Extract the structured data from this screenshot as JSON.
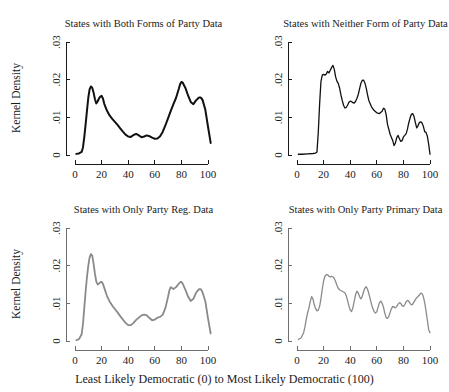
{
  "figure": {
    "xlabel": "Least Likely Democratic (0) to Most Likely Democratic (100)",
    "ylabel": "Kernel Density",
    "background_color": "#ffffff"
  },
  "chart_data": [
    {
      "type": "line",
      "panel": "top-left",
      "title": "States with Both Forms of Party Data",
      "xlabel": "",
      "ylabel": "Kernel Density",
      "xlim": [
        0,
        103
      ],
      "ylim": [
        0,
        0.03
      ],
      "xticks": [
        0,
        20,
        40,
        60,
        80,
        100
      ],
      "xtick_labels": [
        "0",
        "20",
        "40",
        "60",
        "80",
        "100"
      ],
      "yticks": [
        0,
        0.01,
        0.02,
        0.03
      ],
      "ytick_labels": [
        "0",
        ".01",
        ".02",
        ".03"
      ],
      "grid": false,
      "legend": "none",
      "line_color": "#111111",
      "line_width": 2.0,
      "x": [
        1,
        3,
        5,
        6,
        7,
        8,
        9,
        10,
        11,
        12,
        13,
        14,
        15,
        16,
        17,
        18,
        19,
        20,
        21,
        22,
        24,
        26,
        28,
        30,
        32,
        34,
        36,
        38,
        40,
        42,
        44,
        46,
        48,
        50,
        52,
        54,
        56,
        58,
        60,
        62,
        64,
        66,
        68,
        70,
        72,
        74,
        76,
        78,
        79,
        80,
        81,
        83,
        85,
        87,
        89,
        91,
        93,
        94,
        95,
        96,
        98,
        100,
        102
      ],
      "y": [
        0.0003,
        0.0004,
        0.0008,
        0.002,
        0.0048,
        0.0082,
        0.0118,
        0.0152,
        0.0175,
        0.0182,
        0.0178,
        0.0165,
        0.0148,
        0.0137,
        0.0142,
        0.015,
        0.0155,
        0.0157,
        0.015,
        0.0136,
        0.0118,
        0.0105,
        0.0096,
        0.0088,
        0.008,
        0.0071,
        0.0062,
        0.0054,
        0.0049,
        0.0048,
        0.0053,
        0.0056,
        0.0052,
        0.0047,
        0.0049,
        0.0052,
        0.005,
        0.0046,
        0.0043,
        0.0044,
        0.005,
        0.0062,
        0.0079,
        0.0098,
        0.0117,
        0.0135,
        0.0152,
        0.0175,
        0.0188,
        0.0194,
        0.0192,
        0.0178,
        0.0158,
        0.0141,
        0.0135,
        0.0145,
        0.0152,
        0.0153,
        0.0151,
        0.0145,
        0.012,
        0.0075,
        0.0032
      ]
    },
    {
      "type": "line",
      "panel": "top-right",
      "title": "States with Neither Form of Party Data",
      "xlabel": "",
      "ylabel": "",
      "xlim": [
        0,
        103
      ],
      "ylim": [
        0,
        0.03
      ],
      "xticks": [
        0,
        20,
        40,
        60,
        80,
        100
      ],
      "xtick_labels": [
        "0",
        "20",
        "40",
        "60",
        "80",
        "100"
      ],
      "yticks": [
        0,
        0.01,
        0.02,
        0.03
      ],
      "ytick_labels": [
        "0",
        ".01",
        ".02",
        ".03"
      ],
      "grid": false,
      "legend": "none",
      "line_color": "#111111",
      "line_width": 1.3,
      "x": [
        1,
        4,
        8,
        12,
        14,
        15,
        16,
        17,
        18,
        19,
        20,
        21,
        22,
        23,
        24,
        25,
        26,
        27,
        28,
        29,
        30,
        31,
        32,
        33,
        34,
        35,
        36,
        37,
        38,
        39,
        40,
        41,
        42,
        43,
        44,
        45,
        46,
        47,
        48,
        49,
        50,
        51,
        52,
        53,
        54,
        56,
        58,
        60,
        62,
        64,
        65,
        66,
        67,
        68,
        70,
        72,
        73,
        74,
        75,
        76,
        77,
        78,
        79,
        80,
        81,
        82,
        83,
        84,
        85,
        86,
        87,
        88,
        89,
        90,
        91,
        92,
        93,
        94,
        95,
        96,
        97,
        98,
        99,
        100
      ],
      "y": [
        0.0002,
        0.0002,
        0.0003,
        0.0004,
        0.0005,
        0.0008,
        0.006,
        0.0135,
        0.0195,
        0.0212,
        0.0214,
        0.0212,
        0.0215,
        0.0222,
        0.0218,
        0.0225,
        0.0232,
        0.0238,
        0.0228,
        0.0208,
        0.0196,
        0.019,
        0.0178,
        0.016,
        0.0145,
        0.0132,
        0.0125,
        0.0126,
        0.0132,
        0.014,
        0.0143,
        0.0142,
        0.0139,
        0.0138,
        0.0142,
        0.015,
        0.016,
        0.0175,
        0.019,
        0.0198,
        0.0199,
        0.0192,
        0.0178,
        0.016,
        0.0145,
        0.0128,
        0.0118,
        0.0112,
        0.011,
        0.0116,
        0.0124,
        0.0122,
        0.0108,
        0.0082,
        0.0055,
        0.0038,
        0.0025,
        0.0032,
        0.0046,
        0.0052,
        0.0043,
        0.0036,
        0.0038,
        0.0048,
        0.0052,
        0.0056,
        0.0068,
        0.0085,
        0.0098,
        0.0108,
        0.011,
        0.0102,
        0.0086,
        0.0072,
        0.0078,
        0.0086,
        0.0088,
        0.0085,
        0.0076,
        0.0062,
        0.006,
        0.005,
        0.0028,
        0.0002
      ]
    },
    {
      "type": "line",
      "panel": "bottom-left",
      "title": "States with Only Party Reg. Data",
      "xlabel": "",
      "ylabel": "Kernel Density",
      "xlim": [
        0,
        103
      ],
      "ylim": [
        0,
        0.03
      ],
      "xticks": [
        0,
        20,
        40,
        60,
        80,
        100
      ],
      "xtick_labels": [
        "0",
        "20",
        "40",
        "60",
        "80",
        "100"
      ],
      "yticks": [
        0,
        0.01,
        0.02,
        0.03
      ],
      "ytick_labels": [
        "0",
        ".01",
        ".02",
        ".03"
      ],
      "grid": false,
      "legend": "none",
      "line_color": "#8a8a8a",
      "line_width": 1.8,
      "x": [
        1,
        3,
        5,
        6,
        7,
        8,
        9,
        10,
        11,
        12,
        13,
        14,
        15,
        16,
        17,
        18,
        19,
        20,
        21,
        22,
        24,
        26,
        28,
        30,
        32,
        34,
        36,
        38,
        40,
        42,
        44,
        46,
        48,
        50,
        52,
        54,
        56,
        58,
        60,
        62,
        64,
        66,
        68,
        70,
        71,
        72,
        74,
        76,
        78,
        79,
        80,
        81,
        83,
        85,
        87,
        89,
        91,
        93,
        94,
        95,
        96,
        98,
        100,
        102
      ],
      "y": [
        0.0002,
        0.0005,
        0.0018,
        0.0045,
        0.0088,
        0.0132,
        0.017,
        0.02,
        0.0222,
        0.0231,
        0.0226,
        0.0205,
        0.0178,
        0.0158,
        0.015,
        0.0152,
        0.0156,
        0.0157,
        0.0152,
        0.0141,
        0.012,
        0.0105,
        0.0094,
        0.0085,
        0.0076,
        0.0066,
        0.0057,
        0.0048,
        0.0042,
        0.0042,
        0.0048,
        0.0056,
        0.0062,
        0.0068,
        0.007,
        0.0068,
        0.0061,
        0.0055,
        0.0057,
        0.0062,
        0.0064,
        0.007,
        0.0088,
        0.0118,
        0.0135,
        0.0143,
        0.0138,
        0.0143,
        0.0152,
        0.0156,
        0.0157,
        0.0152,
        0.0136,
        0.0118,
        0.0106,
        0.0112,
        0.0128,
        0.0137,
        0.0138,
        0.0136,
        0.0128,
        0.0105,
        0.006,
        0.002
      ]
    },
    {
      "type": "line",
      "panel": "bottom-right",
      "title": "States with Only Party Primary Data",
      "xlabel": "",
      "ylabel": "",
      "xlim": [
        0,
        103
      ],
      "ylim": [
        0,
        0.03
      ],
      "xticks": [
        0,
        20,
        40,
        60,
        80,
        100
      ],
      "xtick_labels": [
        "0",
        "20",
        "40",
        "60",
        "80",
        "100"
      ],
      "yticks": [
        0,
        0.01,
        0.02,
        0.03
      ],
      "ytick_labels": [
        "0",
        ".01",
        ".02",
        ".03"
      ],
      "grid": false,
      "legend": "none",
      "line_color": "#8a8a8a",
      "line_width": 1.3,
      "x": [
        1,
        3,
        5,
        6,
        7,
        8,
        9,
        10,
        11,
        12,
        13,
        14,
        15,
        16,
        17,
        18,
        19,
        20,
        21,
        22,
        23,
        24,
        25,
        26,
        27,
        28,
        29,
        30,
        31,
        32,
        33,
        34,
        35,
        36,
        37,
        38,
        39,
        40,
        41,
        42,
        43,
        44,
        45,
        46,
        47,
        48,
        49,
        50,
        51,
        52,
        53,
        54,
        55,
        56,
        57,
        58,
        59,
        60,
        61,
        62,
        63,
        64,
        65,
        66,
        67,
        68,
        69,
        70,
        71,
        72,
        73,
        74,
        75,
        76,
        77,
        78,
        79,
        80,
        81,
        82,
        83,
        84,
        85,
        86,
        87,
        88,
        89,
        90,
        91,
        92,
        93,
        94,
        95,
        96,
        97,
        98,
        99,
        100
      ],
      "y": [
        0.0004,
        0.0008,
        0.0022,
        0.0038,
        0.0058,
        0.0075,
        0.0088,
        0.0105,
        0.0118,
        0.0112,
        0.0096,
        0.0086,
        0.008,
        0.0082,
        0.0092,
        0.0112,
        0.0138,
        0.016,
        0.0172,
        0.0176,
        0.0176,
        0.0172,
        0.017,
        0.0172,
        0.017,
        0.0166,
        0.0158,
        0.0148,
        0.014,
        0.0136,
        0.0134,
        0.0132,
        0.013,
        0.0128,
        0.012,
        0.0108,
        0.0094,
        0.0082,
        0.0078,
        0.0088,
        0.0105,
        0.0122,
        0.0132,
        0.0128,
        0.0118,
        0.0112,
        0.0118,
        0.013,
        0.014,
        0.0144,
        0.0138,
        0.0126,
        0.0112,
        0.0098,
        0.0086,
        0.0078,
        0.0074,
        0.0078,
        0.009,
        0.0102,
        0.0106,
        0.01,
        0.009,
        0.0074,
        0.0062,
        0.006,
        0.0065,
        0.0076,
        0.0086,
        0.0092,
        0.009,
        0.0088,
        0.0092,
        0.0098,
        0.0102,
        0.01,
        0.0094,
        0.0092,
        0.0096,
        0.0104,
        0.0108,
        0.0106,
        0.01,
        0.0096,
        0.0098,
        0.0104,
        0.011,
        0.0115,
        0.0118,
        0.0122,
        0.0127,
        0.0126,
        0.0118,
        0.0102,
        0.008,
        0.0055,
        0.003,
        0.0022
      ]
    }
  ]
}
